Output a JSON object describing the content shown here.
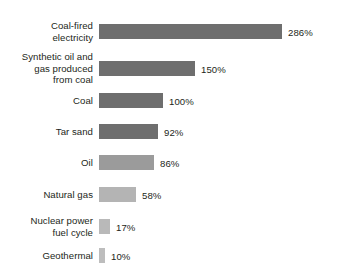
{
  "chart_data": {
    "type": "bar",
    "orientation": "horizontal",
    "title": "",
    "subtitle": "",
    "xlabel": "",
    "ylabel": "",
    "grid": false,
    "legend": "none",
    "xlim": [
      0,
      286
    ],
    "unit": "%",
    "categories": [
      "Coal-fired\nelectricity",
      "Synthetic oil and\ngas produced\nfrom coal",
      "Coal",
      "Tar sand",
      "Oil",
      "Natural gas",
      "Nuclear power\nfuel cycle",
      "Geothermal"
    ],
    "values": [
      286,
      150,
      100,
      92,
      86,
      58,
      17,
      10
    ],
    "value_labels": [
      "286%",
      "150%",
      "100%",
      "92%",
      "86%",
      "58%",
      "17%",
      "10%"
    ],
    "bar_colors": [
      "#6e6e6e",
      "#6e6e6e",
      "#6e6e6e",
      "#6e6e6e",
      "#9b9b9b",
      "#b4b4b4",
      "#b9b9b9",
      "#bdbdbd"
    ],
    "bars": [
      {
        "label": "Coal-fired\nelectricity",
        "value": 286,
        "value_label": "286%",
        "color": "#6e6e6e",
        "top": 24
      },
      {
        "label": "Synthetic oil and\ngas produced\nfrom coal",
        "value": 150,
        "value_label": "150%",
        "color": "#6e6e6e",
        "top": 61
      },
      {
        "label": "Coal",
        "value": 100,
        "value_label": "100%",
        "color": "#6e6e6e",
        "top": 93
      },
      {
        "label": "Tar sand",
        "value": 92,
        "value_label": "92%",
        "color": "#6e6e6e",
        "top": 124
      },
      {
        "label": "Oil",
        "value": 86,
        "value_label": "86%",
        "color": "#9b9b9b",
        "top": 155
      },
      {
        "label": "Natural gas",
        "value": 58,
        "value_label": "58%",
        "color": "#b4b4b4",
        "top": 187
      },
      {
        "label": "Nuclear power\nfuel cycle",
        "value": 17,
        "value_label": "17%",
        "color": "#b9b9b9",
        "top": 219
      },
      {
        "label": "Geothermal",
        "value": 10,
        "value_label": "10%",
        "color": "#bdbdbd",
        "top": 248
      }
    ],
    "scale_px_per_percent": 0.64,
    "bar_origin_x": 99,
    "bar_height_px": 15
  }
}
